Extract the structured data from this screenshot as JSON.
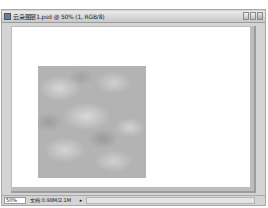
{
  "window": {
    "title": "云朵图层1.psd @ 50% (1, RGB/8)",
    "buttons": [
      {
        "name": "minimize",
        "icon": "minimize-icon"
      },
      {
        "name": "maximize",
        "icon": "maximize-icon"
      },
      {
        "name": "close",
        "icon": "close-icon"
      }
    ]
  },
  "canvas": {
    "background": "#ffffff",
    "content": "clouds-filter-square",
    "cloud_colors": [
      "#b3b3b3",
      "#d6d6d6",
      "#9a9a9a"
    ]
  },
  "statusbar": {
    "zoom_level": "50%",
    "doc_size": "文档:0.98M/2.1M",
    "arrow": "▸"
  }
}
